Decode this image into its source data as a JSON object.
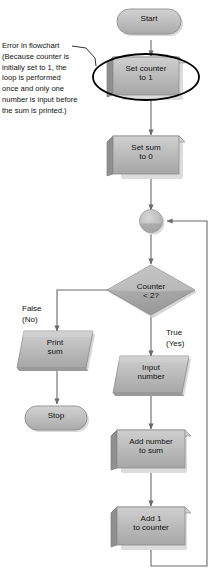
{
  "diagram": {
    "type": "flowchart",
    "annotation": {
      "text": "Error in flowchart\n(Because counter is\ninitially set to 1, the\nloop is performed\nonce and only one\nnumber is input before\nthe sum is printed.)"
    },
    "nodes": [
      {
        "id": "start",
        "shape": "terminator",
        "label": "Start"
      },
      {
        "id": "set-counter",
        "shape": "process",
        "label": "Set counter\nto 1",
        "highlighted": true
      },
      {
        "id": "set-sum",
        "shape": "process",
        "label": "Set sum\nto 0"
      },
      {
        "id": "connector",
        "shape": "connector",
        "label": ""
      },
      {
        "id": "decision",
        "shape": "decision",
        "label": "Counter\n< 2?"
      },
      {
        "id": "print-sum",
        "shape": "parallelogram",
        "label": "Print\nsum"
      },
      {
        "id": "stop",
        "shape": "terminator",
        "label": "Stop"
      },
      {
        "id": "input-number",
        "shape": "parallelogram",
        "label": "Input\nnumber"
      },
      {
        "id": "add-number",
        "shape": "process",
        "label": "Add number\nto sum"
      },
      {
        "id": "add-one",
        "shape": "process",
        "label": "Add 1\nto counter"
      }
    ],
    "branch_labels": {
      "false": "False\n(No)",
      "true": "True\n(Yes)"
    },
    "colors": {
      "shape_fill": "#b4b4b4",
      "shape_fill_light": "#c8c8c8",
      "shape_edge": "#8e8e8e",
      "shape_shadow": "#d6d6d6",
      "line": "#5a5a5a",
      "highlight_ring": "#000000",
      "text": "#111111",
      "background": "#ffffff"
    }
  }
}
